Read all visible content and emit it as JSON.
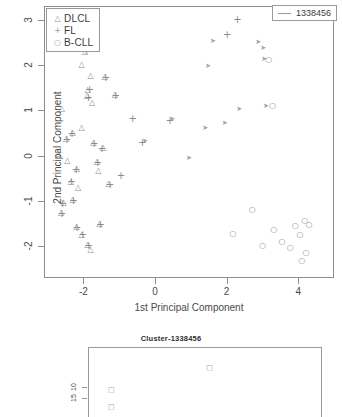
{
  "chart_data": {
    "type": "scatter",
    "title": "",
    "xlabel": "1st Principal Component",
    "ylabel": "2nd Principal Component",
    "xlim": [
      -3.1,
      5.0
    ],
    "ylim": [
      -2.7,
      3.3
    ],
    "xticks": [
      "-2",
      "0",
      "2",
      "4"
    ],
    "xtickvals": [
      -2,
      0,
      2,
      4
    ],
    "yticks": [
      "-2",
      "-1",
      "0",
      "1",
      "2",
      "3"
    ],
    "ytickvals": [
      -2,
      -1,
      0,
      1,
      2,
      3
    ],
    "grid": false,
    "legend_position": "top-left",
    "series": [
      {
        "name": "DLCL",
        "symbol": "triangle",
        "points": [
          [
            -1.95,
            2.3
          ],
          [
            -2.05,
            2.02
          ],
          [
            -1.8,
            1.78
          ],
          [
            -1.4,
            1.75
          ],
          [
            -1.88,
            1.46
          ],
          [
            -1.9,
            1.33
          ],
          [
            -1.76,
            1.18
          ],
          [
            -2.6,
            1.05
          ],
          [
            -1.12,
            1.36
          ],
          [
            -2.3,
            0.52
          ],
          [
            -2.7,
            0.05
          ],
          [
            -2.45,
            -0.1
          ],
          [
            -2.18,
            -0.28
          ],
          [
            -2.35,
            -0.55
          ],
          [
            -2.15,
            -0.7
          ],
          [
            -2.3,
            -0.95
          ],
          [
            -2.55,
            -1.02
          ],
          [
            -2.62,
            -1.25
          ],
          [
            -2.2,
            -1.55
          ],
          [
            -2.05,
            -1.72
          ],
          [
            -1.88,
            -1.95
          ],
          [
            -1.8,
            -2.05
          ],
          [
            -1.55,
            -1.48
          ],
          [
            -1.3,
            -0.6
          ],
          [
            -1.58,
            -0.32
          ],
          [
            -1.72,
            0.3
          ],
          [
            -2.05,
            0.62
          ],
          [
            -1.45,
            0.18
          ],
          [
            -1.62,
            -0.12
          ],
          [
            -2.48,
            0.38
          ]
        ]
      },
      {
        "name": "FL",
        "symbol": "plus",
        "points": [
          [
            -1.92,
            2.32
          ],
          [
            -1.82,
            1.46
          ],
          [
            -1.86,
            1.3
          ],
          [
            -1.38,
            1.73
          ],
          [
            -1.1,
            1.33
          ],
          [
            -2.32,
            0.5
          ],
          [
            -2.2,
            -0.3
          ],
          [
            -2.33,
            -0.57
          ],
          [
            -2.28,
            -0.97
          ],
          [
            -2.58,
            -1.05
          ],
          [
            -2.6,
            -1.27
          ],
          [
            -2.18,
            -1.58
          ],
          [
            -2.02,
            -1.74
          ],
          [
            -1.85,
            -1.98
          ],
          [
            -1.52,
            -1.5
          ],
          [
            -0.62,
            0.82
          ],
          [
            -0.35,
            0.3
          ],
          [
            0.42,
            0.78
          ],
          [
            2.02,
            2.68
          ],
          [
            2.3,
            3.02
          ],
          [
            -1.7,
            0.28
          ],
          [
            -1.6,
            -0.15
          ],
          [
            -1.48,
            0.16
          ],
          [
            -2.46,
            0.36
          ],
          [
            -1.26,
            -0.62
          ],
          [
            -0.95,
            -0.42
          ]
        ]
      },
      {
        "name": "B-CLL",
        "symbol": "circle",
        "points": [
          [
            2.72,
            -1.18
          ],
          [
            3.32,
            -1.62
          ],
          [
            3.0,
            -1.98
          ],
          [
            3.92,
            -1.52
          ],
          [
            4.18,
            -1.42
          ],
          [
            4.3,
            -1.5
          ],
          [
            4.05,
            -1.72
          ],
          [
            3.78,
            -2.02
          ],
          [
            4.22,
            -2.12
          ],
          [
            4.1,
            -2.3
          ],
          [
            2.18,
            -1.7
          ],
          [
            3.55,
            -1.88
          ],
          [
            3.28,
            1.12
          ],
          [
            3.18,
            2.12
          ]
        ]
      },
      {
        "name": "unlabeled-upper-right",
        "symbol": "arrow",
        "points": [
          [
            1.62,
            2.52
          ],
          [
            1.48,
            1.98
          ],
          [
            2.88,
            2.5
          ],
          [
            3.02,
            2.38
          ],
          [
            3.05,
            2.12
          ],
          [
            2.35,
            1.02
          ],
          [
            3.1,
            1.1
          ],
          [
            1.95,
            0.72
          ],
          [
            1.4,
            0.6
          ],
          [
            0.48,
            0.8
          ],
          [
            -0.28,
            0.32
          ],
          [
            0.95,
            -0.05
          ]
        ]
      }
    ]
  },
  "legend": {
    "items": [
      {
        "symbol": "△",
        "label": "DLCL"
      },
      {
        "symbol": "+",
        "label": "FL"
      },
      {
        "symbol": "○",
        "label": "B-CLL"
      }
    ]
  },
  "cluster_legend": {
    "label": "1338456"
  },
  "sub_panel": {
    "title": "Cluster-1338456",
    "yticks": [
      "10",
      "15"
    ],
    "points": [
      [
        0.52,
        0.3
      ],
      [
        0.1,
        0.62
      ],
      [
        0.1,
        0.86
      ]
    ]
  }
}
